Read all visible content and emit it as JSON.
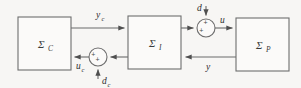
{
  "diagram": {
    "background_color": "#f7f6f4",
    "line_color": "#6b6b6b",
    "text_color": "#2e2e2e",
    "blocks": [
      {
        "id": "controller",
        "symbol": "Σ",
        "subscript": "C",
        "x": 18,
        "y": 17,
        "width": 53,
        "height": 53
      },
      {
        "id": "interconnection",
        "symbol": "Σ",
        "subscript": "I",
        "x": 128,
        "y": 16,
        "width": 53,
        "height": 53
      },
      {
        "id": "plant",
        "symbol": "Σ",
        "subscript": "P",
        "x": 236,
        "y": 18,
        "width": 53,
        "height": 53
      }
    ],
    "junctions": [
      {
        "id": "plant-input-sum",
        "cx": 206,
        "cy": 28,
        "r": 9,
        "sign_top": "+",
        "sign_left": "+"
      },
      {
        "id": "controller-input-sum",
        "cx": 98,
        "cy": 57,
        "r": 9,
        "sign_bottom": "+",
        "sign_left": "+"
      }
    ],
    "signals": [
      {
        "id": "y-c",
        "symbol": "y",
        "subscript": "c",
        "label_x": 96,
        "label_y": 18,
        "description": "controller output to interconnection"
      },
      {
        "id": "d",
        "symbol": "d",
        "subscript": "",
        "label_x": 201,
        "label_y": 11,
        "description": "disturbance into plant input sum"
      },
      {
        "id": "u",
        "symbol": "u",
        "subscript": "",
        "label_x": 222,
        "label_y": 23,
        "description": "plant input"
      },
      {
        "id": "y",
        "symbol": "y",
        "subscript": "",
        "label_x": 208,
        "label_y": 70,
        "description": "plant output feedback"
      },
      {
        "id": "u-c",
        "symbol": "u",
        "subscript": "c",
        "label_x": 78,
        "label_y": 69,
        "description": "controller input"
      },
      {
        "id": "d-c",
        "symbol": "d",
        "subscript": "c",
        "label_x": 103,
        "label_y": 84,
        "description": "controller-side disturbance"
      }
    ]
  }
}
